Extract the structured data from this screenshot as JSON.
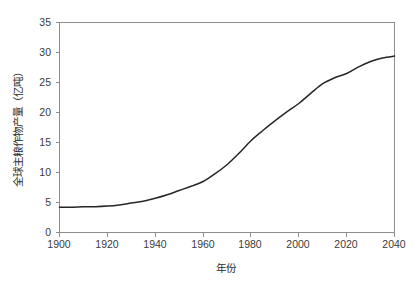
{
  "chart_data": {
    "type": "line",
    "title": "",
    "subtitle": "",
    "xlabel": "年份",
    "ylabel": "全球主粮作物产量（亿吨）",
    "xlim": [
      1900,
      2040
    ],
    "ylim": [
      0,
      35
    ],
    "xticks": [
      1900,
      1920,
      1940,
      1960,
      1980,
      2000,
      2020,
      2040
    ],
    "xtick_labels": [
      "1900",
      "1920",
      "1940",
      "1960",
      "1980",
      "2000",
      "2020",
      "2040"
    ],
    "yticks": [
      0,
      5,
      10,
      15,
      20,
      25,
      30,
      35
    ],
    "ytick_labels": [
      "0",
      "5",
      "10",
      "15",
      "20",
      "25",
      "30",
      "35"
    ],
    "grid": false,
    "legend": false,
    "legend_position": "none",
    "line_color": "#262626",
    "frame_color": "#8e8e8e",
    "background_color": "#ffffff",
    "series": [
      {
        "name": "全球主粮作物产量",
        "x": [
          1900,
          1905,
          1910,
          1915,
          1920,
          1925,
          1930,
          1935,
          1940,
          1945,
          1950,
          1955,
          1960,
          1965,
          1970,
          1975,
          1980,
          1985,
          1990,
          1995,
          2000,
          2005,
          2010,
          2015,
          2020,
          2025,
          2030,
          2035,
          2040
        ],
        "values": [
          4.2,
          4.2,
          4.3,
          4.3,
          4.4,
          4.6,
          4.9,
          5.2,
          5.7,
          6.3,
          7.0,
          7.7,
          8.5,
          9.8,
          11.3,
          13.2,
          15.3,
          17.0,
          18.6,
          20.1,
          21.5,
          23.2,
          24.8,
          25.8,
          26.5,
          27.6,
          28.5,
          29.1,
          29.4
        ]
      }
    ],
    "annotations": []
  },
  "axes": {
    "x_axis_name": "x-axis",
    "y_axis_name": "y-axis"
  }
}
